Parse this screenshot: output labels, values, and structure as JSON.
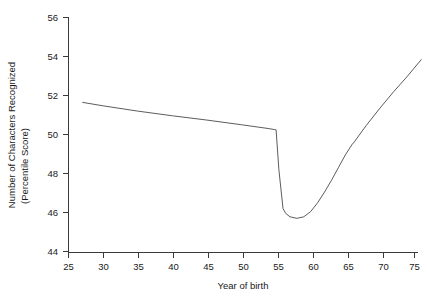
{
  "chart_data": {
    "type": "line",
    "title": "",
    "xlabel": "Year of birth",
    "ylabel": "Number of Characters Recognized (Percentile Score)",
    "ylabel_line1": "Number of Characters Recognized",
    "ylabel_line2": "(Percentile Score)",
    "xlim": [
      23.3,
      77.5
    ],
    "ylim": [
      43.3,
      56.6
    ],
    "xticks": [
      25,
      30,
      35,
      40,
      45,
      50,
      55,
      60,
      65,
      70,
      75
    ],
    "xtick_labels": [
      "25",
      "30",
      "35",
      "40",
      "45",
      "50",
      "55",
      "60",
      "65",
      "70",
      "75"
    ],
    "yticks": [
      44,
      46,
      48,
      50,
      52,
      54,
      56
    ],
    "ytick_labels": [
      "44",
      "46",
      "48",
      "50",
      "52",
      "54",
      "56"
    ],
    "grid": false,
    "legend": null,
    "line_color": "#4a4a4a",
    "discontinuity_at_x": 55,
    "series": [
      {
        "name": "Characters recognized by year of birth",
        "x": [
          27.0,
          30.0,
          35.0,
          40.0,
          45.0,
          50.0,
          54.0,
          54.8,
          55.0,
          55.4,
          56.0,
          56.4,
          57.0,
          58.0,
          59.0,
          60.0,
          61.0,
          62.0,
          63.0,
          64.0,
          65.0,
          66.0,
          66.3,
          68.0,
          70.0,
          72.0,
          74.0,
          76.0
        ],
        "values": [
          51.65,
          51.47,
          51.2,
          50.96,
          50.74,
          50.5,
          50.3,
          50.25,
          50.24,
          48.2,
          46.2,
          45.95,
          45.78,
          45.7,
          45.78,
          46.05,
          46.5,
          47.05,
          47.65,
          48.3,
          48.95,
          49.5,
          49.62,
          50.45,
          51.35,
          52.2,
          53.0,
          53.85
        ]
      }
    ]
  }
}
